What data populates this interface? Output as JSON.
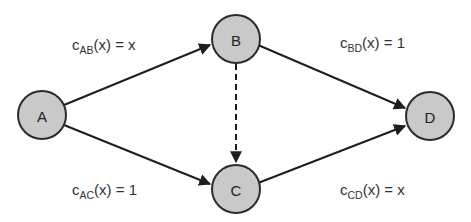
{
  "diagram": {
    "type": "directed-graph",
    "nodes": [
      {
        "id": "A",
        "label": "A",
        "cx": 42,
        "cy": 115,
        "r": 24
      },
      {
        "id": "B",
        "label": "B",
        "cx": 236,
        "cy": 39,
        "r": 24
      },
      {
        "id": "C",
        "label": "C",
        "cx": 236,
        "cy": 189,
        "r": 24
      },
      {
        "id": "D",
        "label": "D",
        "cx": 430,
        "cy": 116,
        "r": 24
      }
    ],
    "edges": [
      {
        "from": "A",
        "to": "B",
        "style": "solid",
        "cost": {
          "c": "c",
          "sub": "AB",
          "rest": "(x) = x"
        }
      },
      {
        "from": "B",
        "to": "D",
        "style": "solid",
        "cost": {
          "c": "c",
          "sub": "BD",
          "rest": "(x) = 1"
        }
      },
      {
        "from": "A",
        "to": "C",
        "style": "solid",
        "cost": {
          "c": "c",
          "sub": "AC",
          "rest": "(x) = 1"
        }
      },
      {
        "from": "C",
        "to": "D",
        "style": "solid",
        "cost": {
          "c": "c",
          "sub": "CD",
          "rest": "(x) = x"
        }
      },
      {
        "from": "B",
        "to": "C",
        "style": "dashed",
        "cost": null
      }
    ]
  },
  "colors": {
    "node_fill": "#c9c9c9",
    "node_stroke": "#2b2b2b",
    "edge": "#1e1e1e",
    "text": "#333333"
  }
}
